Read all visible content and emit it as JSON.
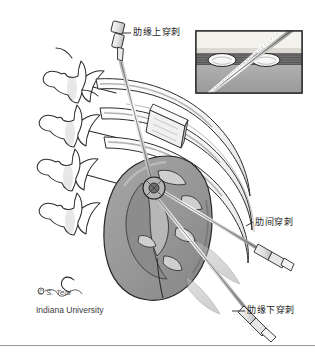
{
  "figure": {
    "width": 315,
    "height": 356,
    "background": "#ffffff"
  },
  "labels": {
    "supracostal": "肋缘上穿刺",
    "intercostal": "肋间穿刺",
    "subcostal": "肋缘下穿刺"
  },
  "credit": {
    "signature": "© S. Teal",
    "institution": "Indiana University"
  },
  "colors": {
    "ink": "#1a1a1a",
    "outline": "#2b2b2b",
    "kidney_fill": "#9d9d9d",
    "kidney_shadow": "#7c7c7c",
    "muscle_fill": "#b8b8b8",
    "rib_fill": "#f2f2f2",
    "inset_skin": "#e8e5df",
    "inset_muscle": "#6f6f6f",
    "inset_deep": "#a9a9a9",
    "needle_steel": "#d8d8d8",
    "border": "#9a9a9a"
  },
  "anatomy": {
    "vertebrae_count": 4,
    "ribs_count": 3,
    "needles": [
      {
        "name": "supracostal-needle",
        "approach": "supracostal"
      },
      {
        "name": "intercostal-needle",
        "approach": "intercostal"
      },
      {
        "name": "subcostal-needle",
        "approach": "subcostal"
      }
    ],
    "inset": {
      "name": "rib-cross-section-inset",
      "rib_sections": 2,
      "layers": [
        "skin",
        "intercostal-muscle",
        "pleura"
      ]
    }
  }
}
